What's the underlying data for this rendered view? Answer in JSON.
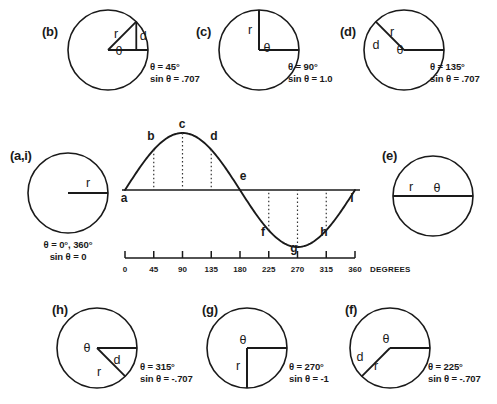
{
  "figure": {
    "stroke_color": "#1a1a1a",
    "dotted_color": "#333333",
    "background": "#ffffff"
  },
  "symbols": {
    "theta": "θ",
    "radius": "r",
    "distance": "d",
    "degree_sign": "°"
  },
  "circles": [
    {
      "id": "b",
      "label": "(b)",
      "angle_deg": 45,
      "theta_text": "θ = 45°",
      "sin_text": "sin θ = .707",
      "radius_label": "r",
      "theta_label": "θ",
      "distance_label": "d",
      "has_triangle": true,
      "cx": 108,
      "cy": 50,
      "r": 40,
      "label_x": 42,
      "label_y": 36,
      "text_x": 150,
      "text_y": 70
    },
    {
      "id": "c",
      "label": "(c)",
      "angle_deg": 90,
      "theta_text": "θ = 90°",
      "sin_text": "sin θ = 1.0",
      "radius_label": "r",
      "theta_label": "θ",
      "distance_label": "",
      "has_triangle": false,
      "cx": 259,
      "cy": 50,
      "r": 40,
      "label_x": 196,
      "label_y": 36,
      "text_x": 288,
      "text_y": 70
    },
    {
      "id": "d",
      "label": "(d)",
      "angle_deg": 135,
      "theta_text": "θ = 135°",
      "sin_text": "sin θ = .707",
      "radius_label": "r",
      "theta_label": "θ",
      "distance_label": "d",
      "has_triangle": false,
      "cx": 404,
      "cy": 50,
      "r": 40,
      "label_x": 340,
      "label_y": 36,
      "text_x": 430,
      "text_y": 70
    },
    {
      "id": "a,i",
      "label": "(a,i)",
      "angle_deg": 0,
      "theta_text": "θ = 0°, 360°",
      "sin_text": "sin θ = 0",
      "radius_label": "r",
      "theta_label": "",
      "distance_label": "",
      "has_triangle": false,
      "cx": 68,
      "cy": 193,
      "r": 40,
      "label_x": 10,
      "label_y": 160,
      "text_x": 68,
      "text_y": 248
    },
    {
      "id": "e",
      "label": "(e)",
      "angle_deg": 180,
      "theta_text": "",
      "sin_text": "",
      "radius_label": "r",
      "theta_label": "θ",
      "distance_label": "",
      "has_triangle": false,
      "cx": 433,
      "cy": 196,
      "r": 40,
      "label_x": 382,
      "label_y": 160,
      "text_x": 0,
      "text_y": 0
    },
    {
      "id": "h",
      "label": "(h)",
      "angle_deg": 315,
      "theta_text": "θ = 315°",
      "sin_text": "sin θ = -.707",
      "radius_label": "r",
      "theta_label": "θ",
      "distance_label": "d",
      "has_triangle": false,
      "cx": 97,
      "cy": 348,
      "r": 40,
      "label_x": 52,
      "label_y": 314,
      "text_x": 140,
      "text_y": 370
    },
    {
      "id": "g",
      "label": "(g)",
      "angle_deg": 270,
      "theta_text": "θ = 270°",
      "sin_text": "sin θ = -1",
      "radius_label": "r",
      "theta_label": "θ",
      "distance_label": "",
      "has_triangle": false,
      "cx": 247,
      "cy": 348,
      "r": 40,
      "label_x": 202,
      "label_y": 314,
      "text_x": 289,
      "text_y": 370
    },
    {
      "id": "f",
      "label": "(f)",
      "angle_deg": 225,
      "theta_text": "θ = 225°",
      "sin_text": "sin θ = -.707",
      "radius_label": "r",
      "theta_label": "θ",
      "distance_label": "d",
      "has_triangle": false,
      "cx": 390,
      "cy": 348,
      "r": 40,
      "label_x": 345,
      "label_y": 314,
      "text_x": 428,
      "text_y": 370
    }
  ],
  "chart_data": {
    "type": "line",
    "title": "",
    "xlabel": "DEGREES",
    "ylabel": "",
    "x": [
      0,
      45,
      90,
      135,
      180,
      225,
      270,
      315,
      360
    ],
    "y": [
      0,
      0.707,
      1.0,
      0.707,
      0,
      -0.707,
      -1.0,
      -0.707,
      0
    ],
    "function": "sin θ",
    "xlim": [
      0,
      360
    ],
    "ylim": [
      -1,
      1
    ],
    "grid": false,
    "legend": null,
    "tick_labels": [
      "0",
      "45",
      "90",
      "135",
      "180",
      "225",
      "270",
      "315",
      "360"
    ],
    "point_labels": [
      "a",
      "b",
      "c",
      "d",
      "e",
      "f",
      "g",
      "h",
      "i"
    ],
    "points": [
      {
        "label": "a",
        "deg": 0,
        "sin": 0,
        "lx": 124,
        "ly": 202,
        "dotted": false
      },
      {
        "label": "b",
        "deg": 45,
        "sin": 0.707,
        "lx": 151,
        "ly": 140,
        "dotted": true
      },
      {
        "label": "c",
        "deg": 90,
        "sin": 1.0,
        "lx": 182,
        "ly": 128,
        "dotted": true
      },
      {
        "label": "d",
        "deg": 135,
        "sin": 0.707,
        "lx": 214,
        "ly": 140,
        "dotted": true
      },
      {
        "label": "e",
        "deg": 180,
        "sin": 0,
        "lx": 243,
        "ly": 180,
        "dotted": false
      },
      {
        "label": "f",
        "deg": 225,
        "sin": -0.707,
        "lx": 263,
        "ly": 236,
        "dotted": true
      },
      {
        "label": "g",
        "deg": 270,
        "sin": -1.0,
        "lx": 294,
        "ly": 252,
        "dotted": true
      },
      {
        "label": "h",
        "deg": 315,
        "sin": -0.707,
        "lx": 324,
        "ly": 236,
        "dotted": true
      },
      {
        "label": "i",
        "deg": 360,
        "sin": 0,
        "lx": 352,
        "ly": 202,
        "dotted": false
      }
    ],
    "geometry": {
      "x0": 125,
      "x1": 355,
      "baseline_y": 190,
      "amplitude": 57,
      "scale_y": 258,
      "scale_tick_h": 7,
      "tick_text_y": 272
    },
    "axis_title_x": 370,
    "axis_title_y": 272
  }
}
